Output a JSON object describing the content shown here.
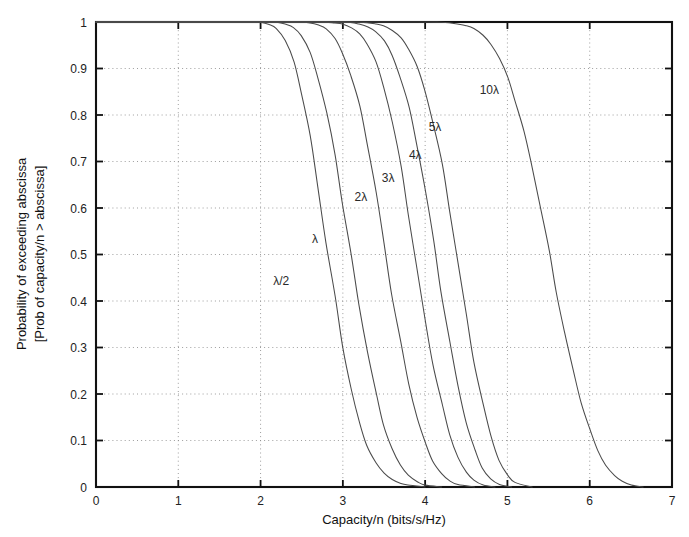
{
  "chart_data": {
    "type": "line",
    "title": "",
    "xlabel": "Capacity/n (bits/s/Hz)",
    "ylabel_line1": "Probability of exceeding abscissa",
    "ylabel_line2": "[Prob of capacity/n > abscissa]",
    "xlim": [
      0,
      7
    ],
    "ylim": [
      0,
      1
    ],
    "xticks": [
      0,
      1,
      2,
      3,
      4,
      5,
      6,
      7
    ],
    "xtick_labels": [
      "0",
      "1",
      "2",
      "3",
      "4",
      "5",
      "6",
      "7"
    ],
    "yticks": [
      0,
      0.1,
      0.2,
      0.3,
      0.4,
      0.5,
      0.6,
      0.7,
      0.8,
      0.9,
      1
    ],
    "ytick_labels": [
      "0",
      "0.1",
      "0.2",
      "0.3",
      "0.4",
      "0.5",
      "0.6",
      "0.7",
      "0.8",
      "0.9",
      "1"
    ],
    "grid": true,
    "grid_style": "dotted",
    "legend": "inline-curve-labels",
    "line_color": "#4a4a4a",
    "series": [
      {
        "name": "λ/2",
        "label": "λ/2",
        "label_x": 2.25,
        "label_y": 0.435,
        "x": [
          0.0,
          1.0,
          1.5,
          1.9,
          2.0,
          2.1,
          2.2,
          2.3,
          2.4,
          2.5,
          2.6,
          2.7,
          2.8,
          2.9,
          3.0,
          3.1,
          3.2,
          3.3,
          3.4,
          3.5,
          3.6,
          3.7,
          3.8,
          4.0
        ],
        "y": [
          1.0,
          1.0,
          1.0,
          1.0,
          0.999,
          0.995,
          0.985,
          0.96,
          0.915,
          0.845,
          0.755,
          0.645,
          0.525,
          0.41,
          0.3,
          0.21,
          0.14,
          0.088,
          0.052,
          0.03,
          0.016,
          0.008,
          0.003,
          0.0
        ]
      },
      {
        "name": "λ",
        "label": "λ",
        "label_x": 2.66,
        "label_y": 0.525,
        "x": [
          0.0,
          1.5,
          2.0,
          2.2,
          2.3,
          2.4,
          2.5,
          2.6,
          2.7,
          2.8,
          2.9,
          3.0,
          3.1,
          3.2,
          3.3,
          3.4,
          3.5,
          3.6,
          3.7,
          3.8,
          3.9,
          4.0,
          4.2
        ],
        "y": [
          1.0,
          1.0,
          1.0,
          0.999,
          0.996,
          0.988,
          0.97,
          0.935,
          0.88,
          0.805,
          0.715,
          0.61,
          0.5,
          0.39,
          0.29,
          0.2,
          0.132,
          0.082,
          0.047,
          0.025,
          0.012,
          0.004,
          0.0
        ]
      },
      {
        "name": "2λ",
        "label": "2λ",
        "label_x": 3.22,
        "label_y": 0.615,
        "x": [
          0.0,
          2.0,
          2.4,
          2.6,
          2.7,
          2.8,
          2.9,
          3.0,
          3.1,
          3.2,
          3.3,
          3.4,
          3.5,
          3.6,
          3.7,
          3.8,
          3.9,
          4.0,
          4.1,
          4.2,
          4.3,
          4.4,
          4.6
        ],
        "y": [
          1.0,
          1.0,
          1.0,
          0.998,
          0.994,
          0.985,
          0.965,
          0.932,
          0.885,
          0.82,
          0.735,
          0.635,
          0.525,
          0.415,
          0.312,
          0.222,
          0.15,
          0.095,
          0.055,
          0.029,
          0.013,
          0.005,
          0.0
        ]
      },
      {
        "name": "3λ",
        "label": "3λ",
        "label_x": 3.55,
        "label_y": 0.655,
        "x": [
          0.0,
          2.2,
          2.7,
          2.9,
          3.0,
          3.1,
          3.2,
          3.3,
          3.4,
          3.5,
          3.6,
          3.7,
          3.8,
          3.9,
          4.0,
          4.1,
          4.2,
          4.3,
          4.4,
          4.5,
          4.6,
          4.7,
          4.85
        ],
        "y": [
          1.0,
          1.0,
          1.0,
          0.998,
          0.995,
          0.988,
          0.975,
          0.952,
          0.915,
          0.86,
          0.785,
          0.69,
          0.585,
          0.47,
          0.362,
          0.262,
          0.178,
          0.112,
          0.064,
          0.032,
          0.014,
          0.005,
          0.0
        ]
      },
      {
        "name": "4λ",
        "label": "4λ",
        "label_x": 3.88,
        "label_y": 0.705,
        "x": [
          0.0,
          2.4,
          2.9,
          3.1,
          3.2,
          3.3,
          3.4,
          3.5,
          3.6,
          3.7,
          3.8,
          3.9,
          4.0,
          4.1,
          4.2,
          4.3,
          4.4,
          4.5,
          4.6,
          4.7,
          4.8,
          4.9,
          5.05
        ],
        "y": [
          1.0,
          1.0,
          1.0,
          0.998,
          0.995,
          0.99,
          0.979,
          0.96,
          0.928,
          0.882,
          0.818,
          0.735,
          0.638,
          0.53,
          0.42,
          0.312,
          0.216,
          0.138,
          0.08,
          0.04,
          0.017,
          0.006,
          0.0
        ]
      },
      {
        "name": "5λ",
        "label": "5λ",
        "label_x": 4.12,
        "label_y": 0.765,
        "x": [
          0.0,
          2.6,
          3.1,
          3.3,
          3.4,
          3.5,
          3.6,
          3.7,
          3.8,
          3.9,
          4.0,
          4.1,
          4.2,
          4.3,
          4.4,
          4.5,
          4.6,
          4.7,
          4.8,
          4.9,
          5.0,
          5.1,
          5.3
        ],
        "y": [
          1.0,
          1.0,
          1.0,
          0.998,
          0.996,
          0.991,
          0.982,
          0.967,
          0.942,
          0.905,
          0.852,
          0.782,
          0.695,
          0.592,
          0.482,
          0.372,
          0.268,
          0.178,
          0.108,
          0.057,
          0.026,
          0.009,
          0.0
        ]
      },
      {
        "name": "10λ",
        "label": "10λ",
        "label_x": 4.78,
        "label_y": 0.845,
        "x": [
          0.0,
          3.6,
          4.2,
          4.4,
          4.5,
          4.6,
          4.7,
          4.8,
          4.9,
          5.0,
          5.1,
          5.2,
          5.3,
          5.4,
          5.5,
          5.6,
          5.7,
          5.8,
          5.9,
          6.0,
          6.1,
          6.2,
          6.3,
          6.4,
          6.5,
          6.65
        ],
        "y": [
          1.0,
          1.0,
          0.999,
          0.996,
          0.992,
          0.985,
          0.972,
          0.952,
          0.922,
          0.882,
          0.83,
          0.765,
          0.688,
          0.602,
          0.51,
          0.418,
          0.33,
          0.25,
          0.18,
          0.122,
          0.078,
          0.046,
          0.025,
          0.012,
          0.005,
          0.0
        ]
      }
    ]
  }
}
